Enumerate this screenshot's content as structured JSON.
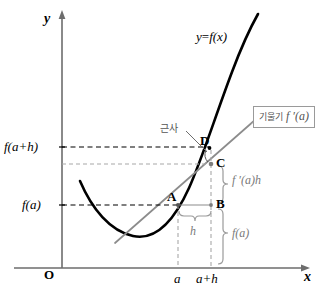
{
  "figure": {
    "kind": "calculus-linear-approximation-diagram",
    "axes": {
      "y_axis_label": "y",
      "x_axis_label": "x",
      "origin_label": "O"
    },
    "curve": {
      "label": "y = f(x)",
      "label_y": "y",
      "label_eq": "=",
      "label_f": "f(x)",
      "color": "#000000"
    },
    "tangent": {
      "color": "#8c8c8c",
      "box_korean": "기울기",
      "box_math": "f ′(a)",
      "box_full": "기울기 f ′(a)"
    },
    "annotation_korean": {
      "text": "근사"
    },
    "y_ticks": [
      {
        "label": "f(a+h)",
        "key": "f_a_plus_h"
      },
      {
        "label": "f(a)",
        "key": "f_a"
      }
    ],
    "x_ticks": [
      {
        "label": "a",
        "key": "a"
      },
      {
        "label": "a+h",
        "key": "a_plus_h"
      }
    ],
    "points": [
      {
        "name": "A",
        "label": "A"
      },
      {
        "name": "B",
        "label": "B"
      },
      {
        "name": "C",
        "label": "C"
      },
      {
        "name": "D",
        "label": "D"
      }
    ],
    "braces": [
      {
        "key": "h",
        "label": "h",
        "orientation": "horizontal"
      },
      {
        "key": "f_prime_a_h",
        "label": "f ′(a)h",
        "orientation": "vertical"
      },
      {
        "key": "f_a",
        "label": "f(a)",
        "orientation": "vertical"
      }
    ],
    "colors": {
      "curve": "#000000",
      "axis": "#6d6d6d",
      "tangent": "#8c8c8c",
      "dashed_black": "#000000",
      "dashed_gray": "#a8a8a8",
      "brace": "#9a9a9a",
      "annotation_text": "#555555"
    }
  }
}
